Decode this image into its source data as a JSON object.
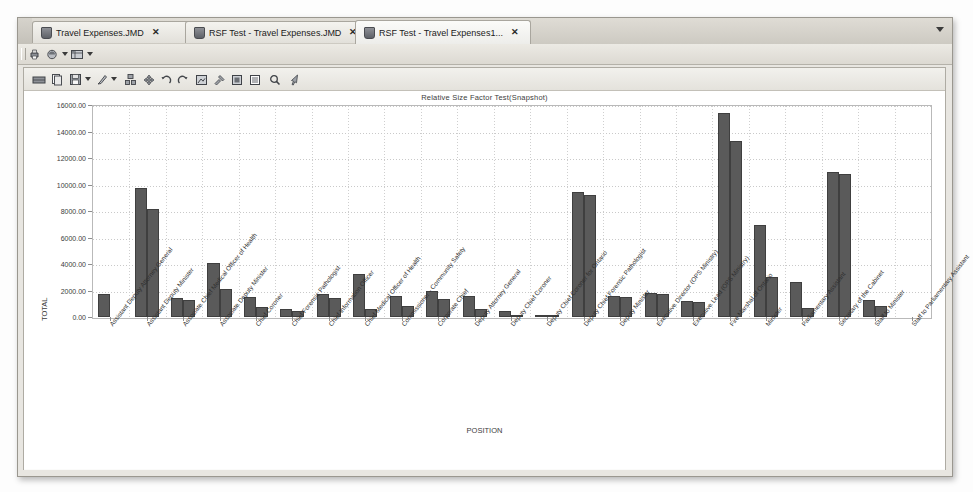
{
  "window": {
    "tabs": [
      {
        "label": "Travel Expenses.JMD",
        "close": "✕",
        "selected": false
      },
      {
        "label": "RSF Test - Travel Expenses.JMD",
        "close": "✕",
        "selected": false
      },
      {
        "label": "RSF Test - Travel Expenses1...",
        "close": "✕",
        "selected": true
      }
    ],
    "tab_overflow_icon": "chevron-down-icon"
  },
  "toolbar_top": {
    "items": [
      {
        "name": "print-icon",
        "glyph": "⎙",
        "has_caret": false
      },
      {
        "name": "export-icon",
        "glyph": "⌾",
        "has_caret": true
      },
      {
        "name": "table-view-icon",
        "glyph": "▦",
        "has_caret": true
      }
    ]
  },
  "toolbar_chart": {
    "items": [
      {
        "name": "data-grid-icon",
        "glyph": "⌸"
      },
      {
        "name": "copy-icon",
        "glyph": "❐"
      },
      {
        "name": "save-icon",
        "glyph": "ὋE",
        "has_caret": true
      },
      {
        "name": "brush-icon",
        "glyph": "✎",
        "has_caret": true
      },
      {
        "name": "layout-icon",
        "glyph": "❖"
      },
      {
        "name": "move-icon",
        "glyph": "✥"
      },
      {
        "name": "undo-icon",
        "glyph": "↶"
      },
      {
        "name": "redo-icon",
        "glyph": "↷"
      },
      {
        "name": "crop-icon",
        "glyph": "⬚"
      },
      {
        "name": "settings-icon",
        "glyph": "⚒"
      },
      {
        "name": "image-icon",
        "glyph": "▣"
      },
      {
        "name": "list-icon",
        "glyph": "☰"
      },
      {
        "name": "zoom-icon",
        "glyph": "⌕"
      },
      {
        "name": "pointer-icon",
        "glyph": "↖"
      }
    ]
  },
  "chart_data": {
    "type": "bar",
    "title": "Relative Size Factor Test(Snapshot)",
    "xlabel": "POSITION",
    "ylabel": "TOTAL",
    "ylim": [
      0,
      16000
    ],
    "ytick_step": 2000,
    "ytick_labels": [
      "0.00",
      "2000.00",
      "4000.00",
      "6000.00",
      "8000.00",
      "10000.00",
      "12000.00",
      "14000.00",
      "16000.00"
    ],
    "grid": true,
    "legend": "none",
    "bar_color": "#5a5a5a",
    "categories": [
      "Assistant Deputy Attorney General",
      "Assistant Deputy Minister",
      "Associate Chief Medical Officer of Health",
      "Associate Deputy Minister",
      "Chief Coroner",
      "Chief Forensic Pathologist",
      "Chief Information Officer",
      "Chief Medical Officer of Health",
      "Commissioner - Community Safety",
      "Corporate Chief",
      "Deputy Attorney General",
      "Deputy Chief Coroner",
      "Deputy Chief Coroner for Ontario",
      "Deputy Chief Forensic Pathologist",
      "Deputy Minister",
      "Executive Director (OPS Ministry)",
      "Executive Lead (OPS Ministry)",
      "Fire Marshal of Ontario",
      "Minister",
      "Parliamentary Assistant",
      "Secretary of the Cabinet",
      "Staff to Minister",
      "Staff to Parliamentary Assistant"
    ],
    "series": [
      {
        "name": "Max",
        "values": [
          1750,
          9750,
          1450,
          4100,
          1500,
          600,
          1750,
          3250,
          1600,
          1950,
          1550,
          450,
          100,
          9450,
          1550,
          1800,
          1200,
          15400,
          6950,
          2650,
          10950,
          1300,
          0
        ]
      },
      {
        "name": "Second",
        "values": [
          0,
          8150,
          1250,
          2150,
          750,
          420,
          1400,
          600,
          800,
          1350,
          600,
          150,
          60,
          9200,
          1500,
          1750,
          1100,
          13300,
          3050,
          700,
          10800,
          850,
          0
        ]
      }
    ]
  }
}
